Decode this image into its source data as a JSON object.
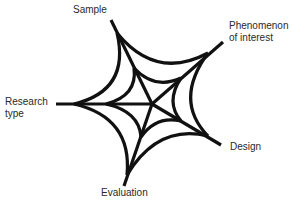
{
  "diagram": {
    "type": "spider-web",
    "stroke_color": "#111111",
    "text_color": "#2a2a2a",
    "background": "#ffffff",
    "center": [
      152,
      104
    ],
    "nodes": [
      {
        "id": "sample",
        "label": "Sample",
        "tip": [
          111,
          20
        ],
        "outer": [
          117,
          33
        ],
        "inner": [
          134,
          68
        ]
      },
      {
        "id": "phenomenon",
        "label": "Phenomenon\nof interest",
        "tip": [
          223,
          42
        ],
        "outer": [
          208,
          53
        ],
        "inner": [
          181,
          78
        ]
      },
      {
        "id": "design",
        "label": "Design",
        "tip": [
          221,
          145
        ],
        "outer": [
          208,
          136
        ],
        "inner": [
          181,
          121
        ]
      },
      {
        "id": "evaluation",
        "label": "Evaluation",
        "tip": [
          124,
          186
        ],
        "outer": [
          127,
          175
        ],
        "inner": [
          141,
          137
        ]
      },
      {
        "id": "research-type",
        "label": "Research\ntype",
        "tip": [
          56,
          104
        ],
        "outer": [
          74,
          104
        ],
        "inner": [
          106,
          104
        ]
      }
    ]
  }
}
